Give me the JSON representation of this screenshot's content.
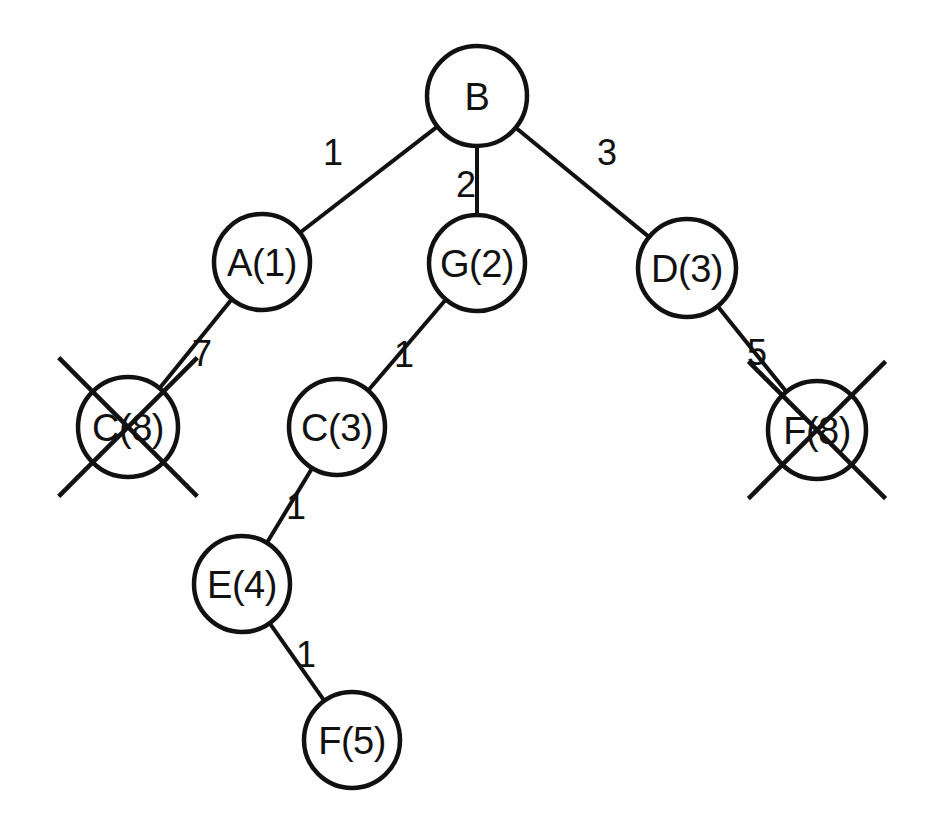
{
  "diagram": {
    "type": "search-tree",
    "canvas": {
      "width": 941,
      "height": 825,
      "background": "#ffffff"
    },
    "stroke_color": "#111111",
    "node_fill": "#ffffff",
    "nodes": [
      {
        "id": "B",
        "label": "B",
        "cx": 477,
        "cy": 96,
        "r": 50,
        "crossed_out": false
      },
      {
        "id": "A1",
        "label": "A(1)",
        "cx": 262,
        "cy": 262,
        "r": 48,
        "crossed_out": false
      },
      {
        "id": "G2",
        "label": "G(2)",
        "cx": 477,
        "cy": 263,
        "r": 48,
        "crossed_out": false
      },
      {
        "id": "D3",
        "label": "D(3)",
        "cx": 687,
        "cy": 268,
        "r": 49,
        "crossed_out": false
      },
      {
        "id": "C8",
        "label": "C(8)",
        "cx": 128,
        "cy": 427,
        "r": 50,
        "crossed_out": true
      },
      {
        "id": "C3",
        "label": "C(3)",
        "cx": 337,
        "cy": 427,
        "r": 48,
        "crossed_out": false
      },
      {
        "id": "F8",
        "label": "F(8)",
        "cx": 817,
        "cy": 430,
        "r": 49,
        "crossed_out": true
      },
      {
        "id": "E4",
        "label": "E(4)",
        "cx": 242,
        "cy": 584,
        "r": 48,
        "crossed_out": false
      },
      {
        "id": "F5",
        "label": "F(5)",
        "cx": 352,
        "cy": 740,
        "r": 48,
        "crossed_out": false
      }
    ],
    "edges": [
      {
        "from": "B",
        "to": "A1",
        "weight": "1",
        "label_x": 333,
        "label_y": 152
      },
      {
        "from": "B",
        "to": "G2",
        "weight": "2",
        "label_x": 466,
        "label_y": 184
      },
      {
        "from": "B",
        "to": "D3",
        "weight": "3",
        "label_x": 607,
        "label_y": 152
      },
      {
        "from": "A1",
        "to": "C8",
        "weight": "7",
        "label_x": 202,
        "label_y": 353
      },
      {
        "from": "G2",
        "to": "C3",
        "weight": "1",
        "label_x": 404,
        "label_y": 354
      },
      {
        "from": "D3",
        "to": "F8",
        "weight": "5",
        "label_x": 757,
        "label_y": 352
      },
      {
        "from": "C3",
        "to": "E4",
        "weight": "1",
        "label_x": 296,
        "label_y": 506
      },
      {
        "from": "E4",
        "to": "F5",
        "weight": "1",
        "label_x": 306,
        "label_y": 654
      }
    ],
    "crossed_out_nodes": [
      "C(8)",
      "F(8)"
    ],
    "legend_note": ""
  }
}
